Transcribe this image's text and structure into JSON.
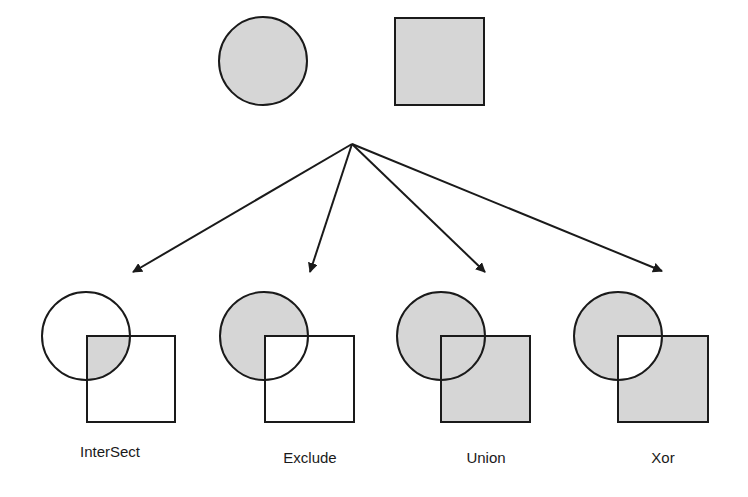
{
  "colors": {
    "fill": "#d6d6d6",
    "stroke": "#1a1a1a",
    "background": "#ffffff"
  },
  "source": {
    "circle": {
      "cx": 263,
      "cy": 61,
      "r": 44
    },
    "square": {
      "x": 395,
      "y": 18,
      "w": 89,
      "h": 87
    }
  },
  "arrow_origin": {
    "x": 352,
    "y": 144
  },
  "operations": [
    {
      "label": "InterSect",
      "name": "intersect",
      "cx": 86,
      "cy": 336,
      "r": 44,
      "sx": 87,
      "sy": 336,
      "sw": 88,
      "sh": 86,
      "tip": {
        "x": 133,
        "y": 272
      },
      "lx": 110,
      "ly": 457
    },
    {
      "label": "Exclude",
      "name": "exclude",
      "cx": 264,
      "cy": 336,
      "r": 44,
      "sx": 265,
      "sy": 336,
      "sw": 89,
      "sh": 86,
      "tip": {
        "x": 310,
        "y": 272
      },
      "lx": 310,
      "ly": 463
    },
    {
      "label": "Union",
      "name": "union",
      "cx": 441,
      "cy": 336,
      "r": 44,
      "sx": 441,
      "sy": 336,
      "sw": 89,
      "sh": 86,
      "tip": {
        "x": 485,
        "y": 272
      },
      "lx": 486,
      "ly": 463
    },
    {
      "label": "Xor",
      "name": "xor",
      "cx": 618,
      "cy": 336,
      "r": 44,
      "sx": 618,
      "sy": 336,
      "sw": 90,
      "sh": 86,
      "tip": {
        "x": 662,
        "y": 271
      },
      "lx": 663,
      "ly": 463
    }
  ]
}
